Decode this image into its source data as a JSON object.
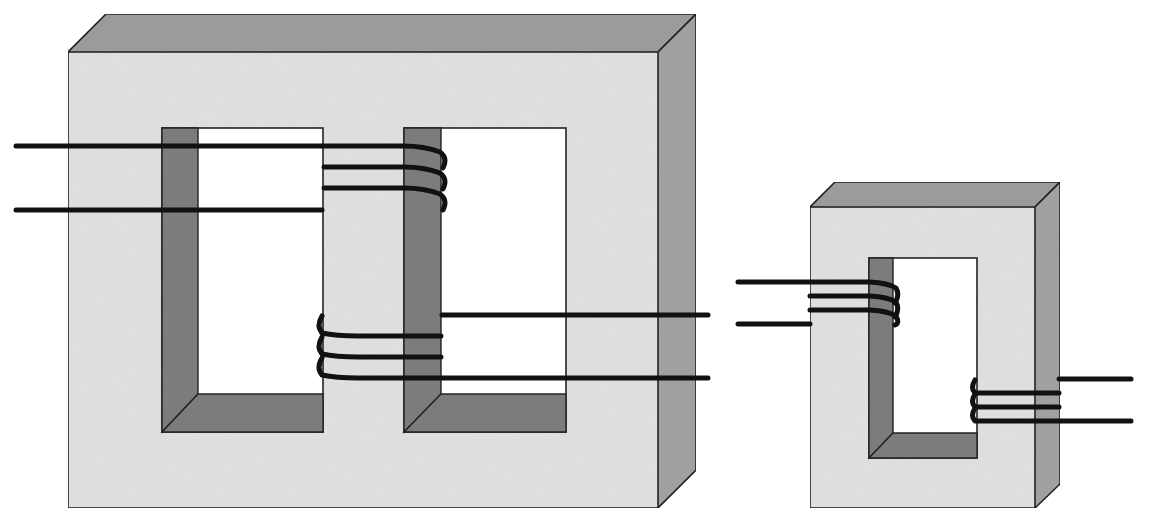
{
  "diagram": {
    "colors": {
      "core_front": "#e3e3e3",
      "core_top": "#9e9e9e",
      "core_side": "#a4a4a4",
      "window_shade": "#7c7c7c",
      "window": "#ffffff",
      "wire": "#111111",
      "outline": "#222222"
    },
    "components": [
      {
        "id": "shell-type-core",
        "description": "Large three-limb (shell-type) core with two windows",
        "windows": 2,
        "windings": [
          {
            "name": "primary",
            "limb": "center-limb-upper",
            "turns": 3,
            "leads": "left"
          },
          {
            "name": "secondary",
            "limb": "center-limb-lower",
            "turns": 3,
            "leads": "right"
          }
        ]
      },
      {
        "id": "core-type-core",
        "description": "Small single-window (core-type) core",
        "windows": 1,
        "windings": [
          {
            "name": "primary",
            "limb": "left-limb",
            "turns": 3,
            "leads": "left"
          },
          {
            "name": "secondary",
            "limb": "right-limb",
            "turns": 3,
            "leads": "right"
          }
        ]
      }
    ]
  }
}
